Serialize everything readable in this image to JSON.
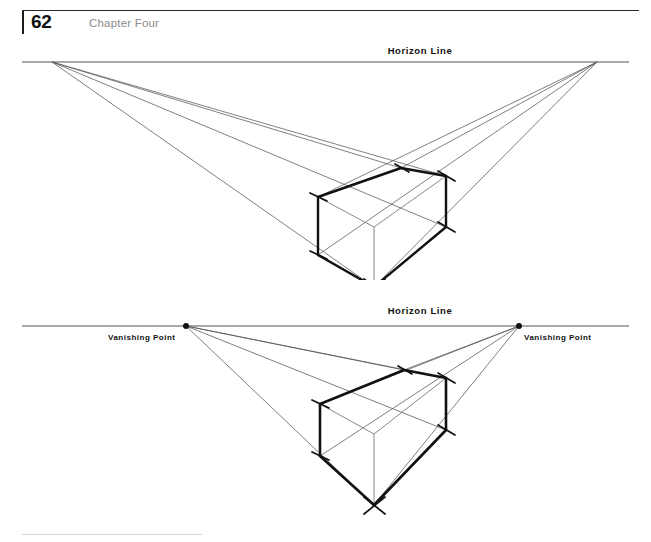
{
  "page": {
    "number": "62",
    "chapter": "Chapter Four",
    "width": 651,
    "height": 542,
    "background": "#ffffff",
    "ink": "#111111",
    "construction_line_color": "#555555",
    "chapter_label_color": "#8c8c8c"
  },
  "diagrams": [
    {
      "id": "two-point-perspective-box-upper",
      "horizon_label": "Horizon Line",
      "horizon_label_x": 420,
      "horizon_label_y": 14,
      "horizon_line": {
        "x1": 22,
        "y1": 22,
        "x2": 629,
        "y2": 22
      },
      "vanishing_points": [
        {
          "name": "left",
          "x": 52,
          "y": 22,
          "label": ""
        },
        {
          "name": "right",
          "x": 597,
          "y": 22,
          "label": ""
        }
      ],
      "box": {
        "top_back": {
          "x": 401,
          "y": 128
        },
        "top_left": {
          "x": 318,
          "y": 157
        },
        "top_right": {
          "x": 446,
          "y": 136
        },
        "top_front": {
          "x": 374,
          "y": 187
        },
        "bottom_left": {
          "x": 318,
          "y": 215
        },
        "bottom_right": {
          "x": 446,
          "y": 187
        },
        "bottom_front": {
          "x": 374,
          "y": 247
        }
      },
      "heavy_edges": [
        "top_left-top_back",
        "top_back-top_right",
        "top_right-bottom_right",
        "bottom_right-bottom_front",
        "bottom_front-bottom_left",
        "bottom_left-top_left"
      ],
      "tick_corners": [
        "top_back",
        "top_left",
        "top_right",
        "bottom_left",
        "bottom_right",
        "bottom_front"
      ]
    },
    {
      "id": "two-point-perspective-box-lower",
      "horizon_label": "Horizon Line",
      "horizon_label_x": 420,
      "horizon_label_y": 14,
      "horizon_line": {
        "x1": 22,
        "y1": 26,
        "x2": 629,
        "y2": 26
      },
      "vanishing_points": [
        {
          "name": "left",
          "x": 186,
          "y": 26,
          "label": "Vanishing Point",
          "label_x": 108,
          "label_y": 40
        },
        {
          "name": "right",
          "x": 519,
          "y": 26,
          "label": "Vanishing Point",
          "label_x": 524,
          "label_y": 40
        }
      ],
      "box": {
        "top_back": {
          "x": 404,
          "y": 370
        },
        "top_left": {
          "x": 320,
          "y": 404
        },
        "top_right": {
          "x": 446,
          "y": 378
        },
        "top_front": {
          "x": 374,
          "y": 434
        },
        "bottom_left": {
          "x": 320,
          "y": 456
        },
        "bottom_right": {
          "x": 446,
          "y": 430
        },
        "bottom_front": {
          "x": 374,
          "y": 505
        }
      },
      "heavy_edges": [
        "top_left-top_back",
        "top_back-top_right",
        "top_right-bottom_right",
        "bottom_right-bottom_front",
        "bottom_front-bottom_left",
        "bottom_left-top_left"
      ],
      "tick_corners": [
        "top_back",
        "top_left",
        "top_right",
        "bottom_left",
        "bottom_right",
        "bottom_front"
      ]
    }
  ]
}
